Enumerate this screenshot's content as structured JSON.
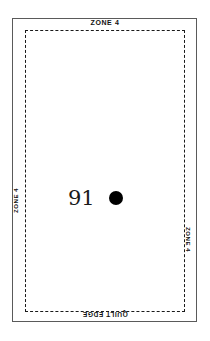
{
  "diagram": {
    "outer_frame": {
      "name": "block-outline",
      "stroke_color": "#5a5a5a"
    },
    "dashed_frame": {
      "name": "seam-allowance-boundary",
      "stroke_color": "#1a1a1a",
      "style": "dashed"
    },
    "edge_labels": {
      "top": "ZONE 4",
      "bottom": "QUILT EDGE",
      "left": "ZONE 4",
      "right": "ZONE 4"
    },
    "center": {
      "piece_number": "91",
      "marker": "filled-circle-marker",
      "marker_color": "#000000"
    },
    "background_color": "#ffffff"
  }
}
